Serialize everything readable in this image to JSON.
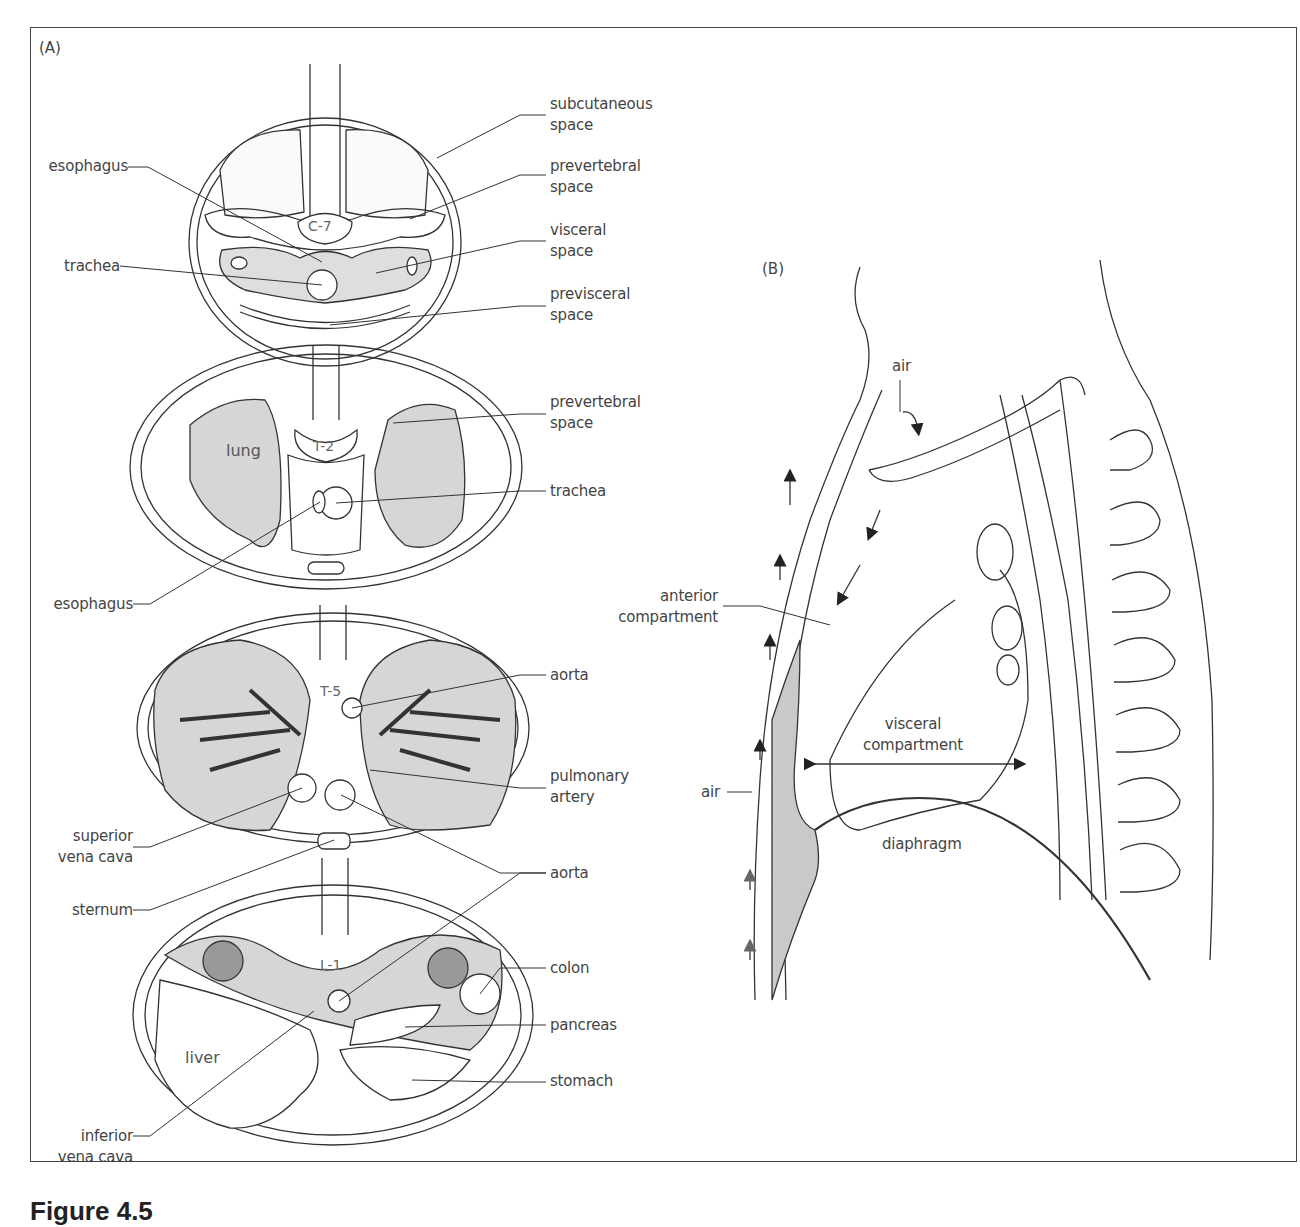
{
  "figure": {
    "caption": "Figure 4.5",
    "panel_a_tag": "(A)",
    "panel_b_tag": "(B)"
  },
  "panel_a": {
    "sections": [
      {
        "level": "C-7"
      },
      {
        "level": "T-2"
      },
      {
        "level": "T-5"
      },
      {
        "level": "L-1"
      }
    ],
    "organ_labels": {
      "lung": "lung",
      "liver": "liver"
    },
    "left_labels": [
      {
        "text": "esophagus"
      },
      {
        "text": "trachea"
      },
      {
        "text": "esophagus"
      },
      {
        "text": "superior\nvena cava"
      },
      {
        "text": "sternum"
      },
      {
        "text": "inferior\nvena cava"
      }
    ],
    "right_labels": [
      {
        "text": "subcutaneous\nspace"
      },
      {
        "text": "prevertebral\nspace"
      },
      {
        "text": "visceral\nspace"
      },
      {
        "text": "previsceral\nspace"
      },
      {
        "text": "prevertebral\nspace"
      },
      {
        "text": "trachea"
      },
      {
        "text": "aorta"
      },
      {
        "text": "pulmonary\nartery"
      },
      {
        "text": "aorta"
      },
      {
        "text": "colon"
      },
      {
        "text": "pancreas"
      },
      {
        "text": "stomach"
      }
    ]
  },
  "panel_b": {
    "labels": {
      "air_top": "air",
      "anterior_compartment": "anterior\ncompartment",
      "visceral_compartment": "visceral\ncompartment",
      "air_left": "air",
      "diaphragm": "diaphragm"
    }
  },
  "colors": {
    "line": "#333333",
    "shade": "#d9d9d9",
    "dark_shade": "#b5b5b5",
    "text": "#444444"
  }
}
